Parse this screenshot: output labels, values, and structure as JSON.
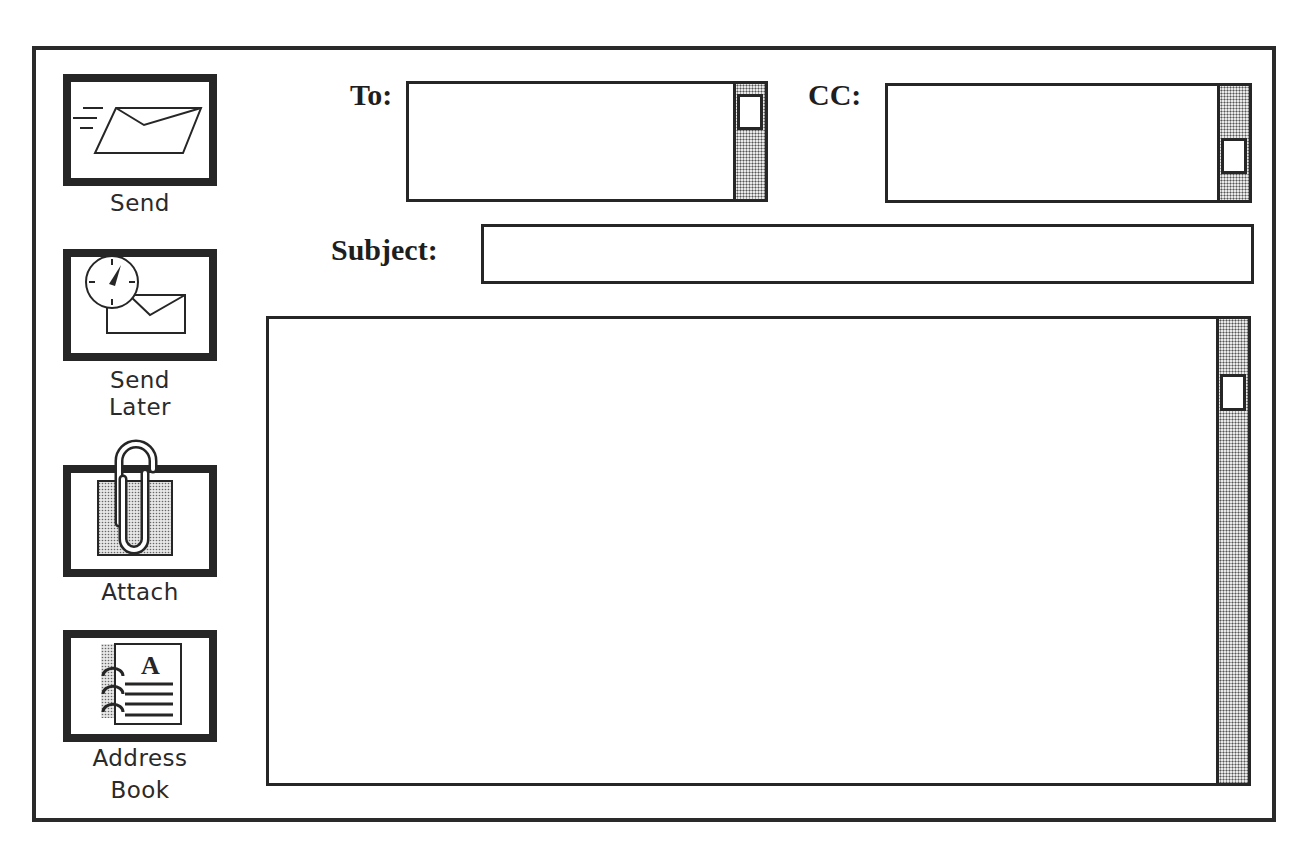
{
  "toolbar": {
    "send": {
      "label": "Send",
      "icon": "envelope-sending-icon"
    },
    "send_later": {
      "label_line1": "Send",
      "label_line2": "Later",
      "icon": "clock-envelope-icon"
    },
    "attach": {
      "label": "Attach",
      "icon": "paperclip-icon"
    },
    "address_book": {
      "label_line1": "Address",
      "label_line2": "Book",
      "icon": "address-book-icon",
      "glyph": "A"
    }
  },
  "fields": {
    "to": {
      "label": "To:",
      "value": ""
    },
    "cc": {
      "label": "CC:",
      "value": ""
    },
    "subject": {
      "label": "Subject:",
      "value": ""
    },
    "body": {
      "value": ""
    }
  },
  "colors": {
    "border": "#262626",
    "background": "#ffffff",
    "scroll_track": "#e8e8e8"
  }
}
